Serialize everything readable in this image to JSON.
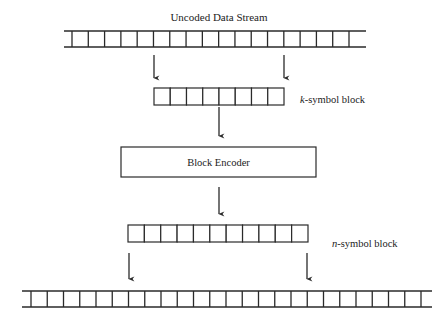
{
  "diagram": {
    "title": "Uncoded Data Stream",
    "k_block_label_var": "k",
    "k_block_label_rest": "-symbol block",
    "encoder_label": "Block Encoder",
    "n_block_label_var": "n",
    "n_block_label_rest": "-symbol block"
  },
  "structure": {
    "uncoded_stream_cells": 17,
    "k_block_cells": 8,
    "n_block_cells": 11,
    "coded_stream_cells": 24
  },
  "colors": {
    "stroke": "#2a2a2a",
    "text": "#222222",
    "background": "#ffffff"
  }
}
